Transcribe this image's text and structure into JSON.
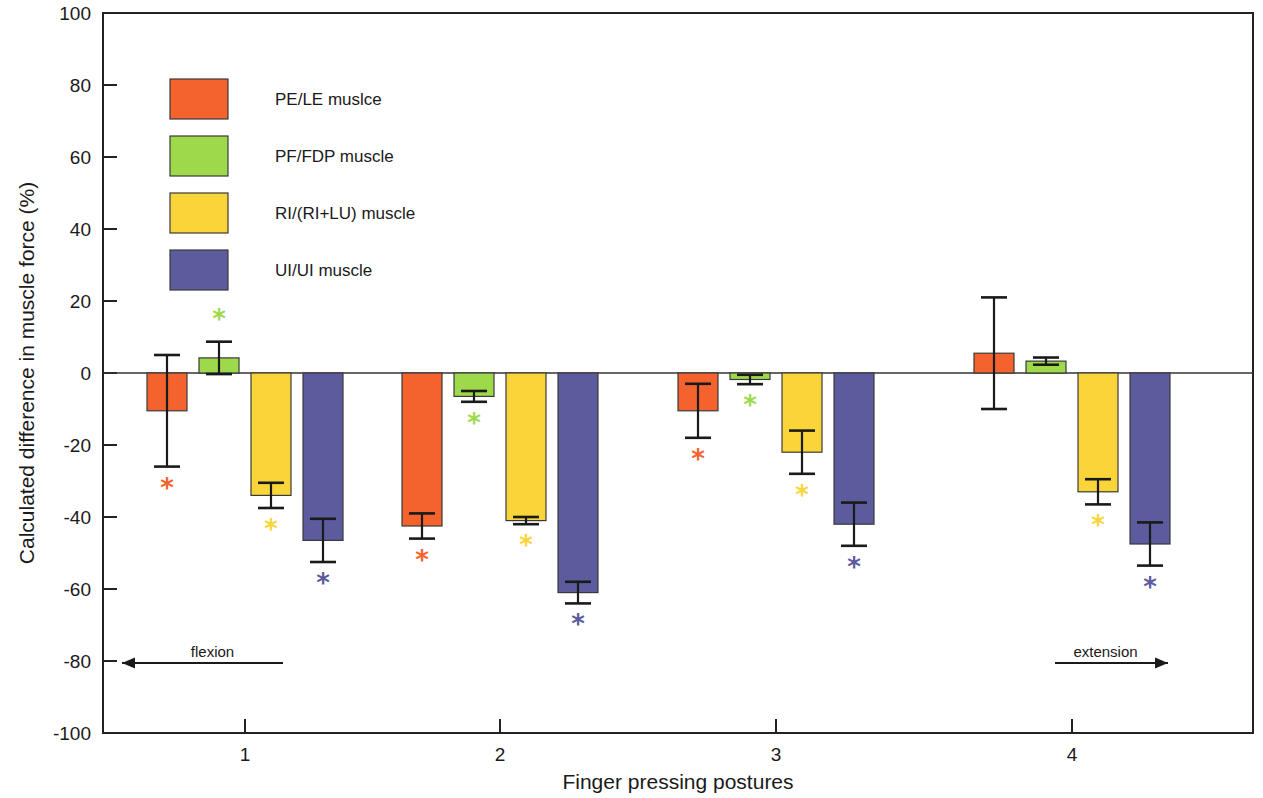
{
  "chart_data": {
    "type": "bar",
    "title": "",
    "xlabel": "Finger pressing postures",
    "ylabel": "Calculated difference in muscle force (%)",
    "categories": [
      "1",
      "2",
      "3",
      "4"
    ],
    "ylim": [
      -100,
      100
    ],
    "yticks": [
      100,
      80,
      60,
      40,
      20,
      0,
      -20,
      -40,
      -60,
      -80,
      -100
    ],
    "ytick_labels": [
      "100",
      "80",
      "60",
      "40",
      "20",
      "0",
      "-20",
      "-40",
      "-60",
      "-80",
      "-100"
    ],
    "grid": false,
    "legend_position": "upper-left-inside",
    "orientation": "vertical-grouped",
    "error_bar_type": "symmetric-std",
    "significance_marker": "*",
    "series": [
      {
        "name": "PE/LE muslce",
        "color": "#F4632E",
        "values": [
          -10.5,
          -42.5,
          -10.5,
          5.5
        ],
        "errors": [
          15.5,
          3.5,
          7.5,
          15.5
        ],
        "significant": [
          true,
          true,
          true,
          false
        ]
      },
      {
        "name": "PF/FDP muscle",
        "color": "#9ED94B",
        "values": [
          4.2,
          -6.5,
          -1.8,
          3.3
        ],
        "errors": [
          4.5,
          1.5,
          1.3,
          1.0
        ],
        "significant": [
          true,
          true,
          true,
          false
        ]
      },
      {
        "name": "RI/(RI+LU) muscle",
        "color": "#FAD53A",
        "values": [
          -34.0,
          -41.0,
          -22.0,
          -33.0
        ],
        "errors": [
          3.5,
          1.0,
          6.0,
          3.5
        ],
        "significant": [
          true,
          true,
          true,
          true
        ]
      },
      {
        "name": "UI/UI muscle",
        "color": "#5B5B9E",
        "values": [
          -46.5,
          -61.0,
          -42.0,
          -47.5
        ],
        "errors": [
          6.0,
          3.0,
          6.0,
          6.0
        ],
        "significant": [
          true,
          true,
          true,
          true
        ]
      }
    ],
    "annotations": [
      {
        "text": "flexion",
        "direction": "left"
      },
      {
        "text": "extension",
        "direction": "right"
      }
    ]
  },
  "legend": {
    "items": [
      {
        "label": "PE/LE muslce",
        "color": "#F4632E"
      },
      {
        "label": "PF/FDP muscle",
        "color": "#9ED94B"
      },
      {
        "label": "RI/(RI+LU) muscle",
        "color": "#FAD53A"
      },
      {
        "label": "UI/UI muscle",
        "color": "#5B5B9E"
      }
    ]
  },
  "axes": {
    "y_title": "Calculated difference in muscle force (%)",
    "x_title": "Finger pressing postures"
  },
  "annotations": {
    "flexion": "flexion",
    "extension": "extension"
  }
}
